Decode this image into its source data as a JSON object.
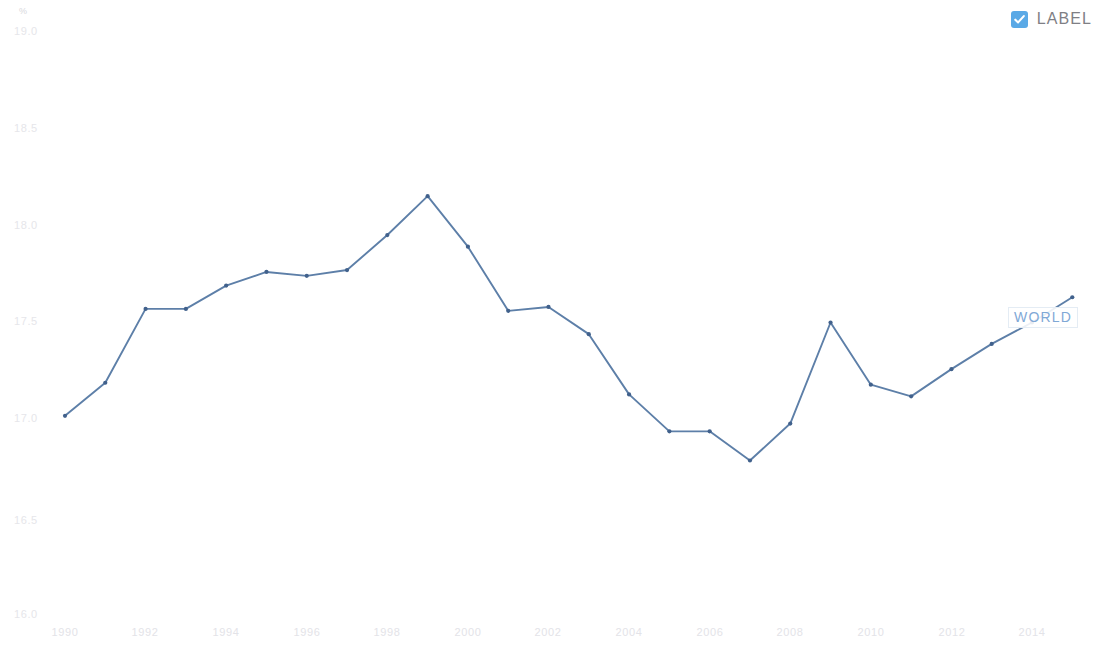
{
  "legend": {
    "checkbox_icon": "check-icon",
    "label": "LABEL",
    "checked": true,
    "accent_color": "#5aa9e6"
  },
  "annotation": {
    "series_label": "WORLD"
  },
  "axis": {
    "y_unit": "%",
    "y_ticks": [
      "19.0",
      "18.5",
      "18.0",
      "17.5",
      "17.0",
      "16.5",
      "16.0"
    ],
    "x_ticks": [
      "1990",
      "1992",
      "1994",
      "1996",
      "1998",
      "2000",
      "2002",
      "2004",
      "2006",
      "2008",
      "2010",
      "2012",
      "2014"
    ]
  },
  "chart_data": {
    "type": "line",
    "title": "",
    "subtitle": "",
    "xlabel": "",
    "ylabel": "%",
    "ylim": [
      16.0,
      19.0
    ],
    "xlim": [
      1990,
      2015
    ],
    "grid": false,
    "legend_position": "top-right",
    "line_color": "#5d7fa8",
    "marker_color": "#41618c",
    "annotations": [
      {
        "text": "WORLD",
        "x": 2013,
        "y": 17.5
      }
    ],
    "series": [
      {
        "name": "WORLD",
        "x": [
          1990,
          1991,
          1992,
          1993,
          1994,
          1995,
          1996,
          1997,
          1998,
          1999,
          2000,
          2001,
          2002,
          2003,
          2004,
          2005,
          2006,
          2007,
          2008,
          2009,
          2010,
          2011,
          2012,
          2013,
          2014,
          2015
        ],
        "values": [
          17.02,
          17.19,
          17.57,
          17.57,
          17.69,
          17.76,
          17.74,
          17.77,
          17.95,
          18.15,
          17.89,
          17.56,
          17.58,
          17.44,
          17.13,
          16.94,
          16.94,
          16.79,
          16.98,
          17.5,
          17.18,
          17.12,
          17.26,
          17.39,
          17.5,
          17.63
        ]
      }
    ]
  }
}
